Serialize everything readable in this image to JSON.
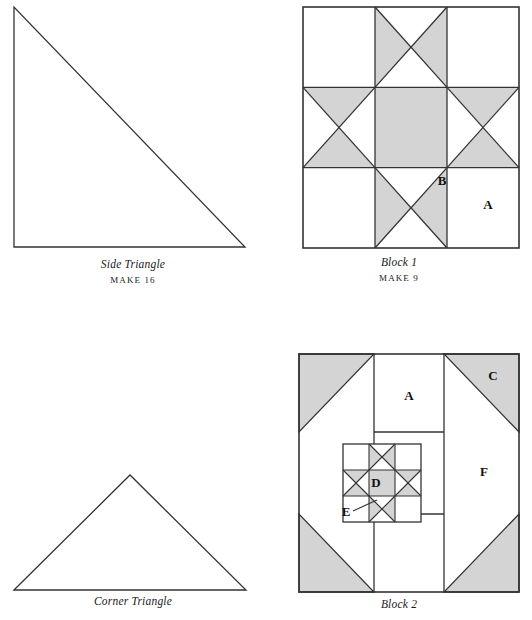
{
  "page": {
    "background_color": "#ffffff",
    "line_color": "#333333",
    "shade_color": "#d4d4d4",
    "text_color": "#1a1a1a"
  },
  "figures": [
    {
      "id": "side-triangle",
      "caption_title": "Side Triangle",
      "caption_make": "MAKE 16",
      "shape": "right-triangle",
      "labels": []
    },
    {
      "id": "block-1",
      "caption_title": "Block 1",
      "caption_make": "MAKE 9",
      "shape": "ohio-star-block",
      "labels": [
        {
          "text": "B",
          "x": 139,
          "y": 181
        },
        {
          "text": "A",
          "x": 185,
          "y": 205
        }
      ]
    },
    {
      "id": "corner-triangle",
      "caption_title": "Corner Triangle",
      "caption_make": "",
      "shape": "isosceles-triangle",
      "labels": []
    },
    {
      "id": "block-2",
      "caption_title": "Block 2",
      "caption_make": "",
      "shape": "nested-star-block",
      "labels": [
        {
          "text": "A",
          "x": 113,
          "y": 40
        },
        {
          "text": "C",
          "x": 194,
          "y": 25
        },
        {
          "text": "F",
          "x": 189,
          "y": 118
        },
        {
          "text": "D",
          "x": 113,
          "y": 128
        },
        {
          "text": "E",
          "x": 84,
          "y": 163
        }
      ]
    }
  ]
}
